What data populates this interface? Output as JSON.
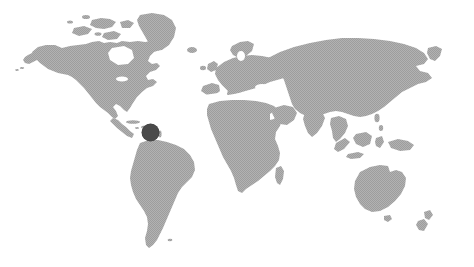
{
  "figure": {
    "name": "world-map-locator",
    "title": "World Map",
    "alt_text": "Grayscale world map with a single dark location marker in the Caribbean region",
    "width": 474,
    "height": 267
  },
  "style": {
    "background_color": "#ffffff",
    "land_color": "#a8a8a8",
    "land_texture": "halftone-dither",
    "marker_color": "#4a4a4a",
    "marker_edge_color": "#3f3f3f"
  },
  "projection": {
    "type": "equirectangular",
    "lon_min": -170,
    "lon_max": 190,
    "lat_min": -58,
    "lat_max": 84
  },
  "markers": [
    {
      "id": "marker-1",
      "label": "Caribbean",
      "x": 150.5,
      "y": 132.5,
      "diameter": 17,
      "color": "#4a4a4a"
    }
  ],
  "regions": [
    {
      "id": "north-america",
      "label": "North America"
    },
    {
      "id": "greenland",
      "label": "Greenland"
    },
    {
      "id": "south-america",
      "label": "South America"
    },
    {
      "id": "europe",
      "label": "Europe"
    },
    {
      "id": "africa",
      "label": "Africa"
    },
    {
      "id": "asia",
      "label": "Asia"
    },
    {
      "id": "australia",
      "label": "Australia"
    },
    {
      "id": "new-zealand",
      "label": "New Zealand"
    },
    {
      "id": "madagascar",
      "label": "Madagascar"
    },
    {
      "id": "japan",
      "label": "Japan"
    },
    {
      "id": "indonesia",
      "label": "Indonesia"
    },
    {
      "id": "british-isles",
      "label": "British Isles"
    }
  ]
}
